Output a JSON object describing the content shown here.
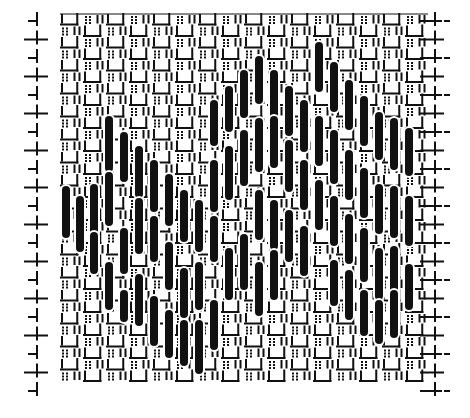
{
  "figure": {
    "description": "Needlework stitch pattern: woven ground with long dark vertical stitches forming a zigzag band",
    "width": 470,
    "height": 418,
    "colors": {
      "ink": "#111111",
      "paper": "#ffffff"
    },
    "grid": {
      "left": 60,
      "top": 14,
      "right": 428,
      "bottom": 384,
      "cell": 11.5,
      "edge_tick_left_x": 30,
      "edge_tick_right_x": 436,
      "edge_tick_rows": 20
    },
    "bars": {
      "width": 8,
      "columns": [
        {
          "x": 66,
          "segments": [
            [
              186,
              238
            ]
          ]
        },
        {
          "x": 80,
          "segments": [
            [
              196,
              252
            ]
          ]
        },
        {
          "x": 94,
          "segments": [
            [
              184,
              236
            ],
            [
              232,
              274
            ]
          ]
        },
        {
          "x": 109,
          "segments": [
            [
              116,
              172
            ],
            [
              172,
              226
            ],
            [
              262,
              310
            ]
          ]
        },
        {
          "x": 124,
          "segments": [
            [
              132,
              182
            ],
            [
              228,
              274
            ],
            [
              290,
              322
            ]
          ]
        },
        {
          "x": 139,
          "segments": [
            [
              146,
              198
            ],
            [
              198,
              254
            ],
            [
              274,
              326
            ]
          ]
        },
        {
          "x": 154,
          "segments": [
            [
              160,
              212
            ],
            [
              216,
              262
            ],
            [
              296,
              346
            ]
          ]
        },
        {
          "x": 169,
          "segments": [
            [
              174,
              226
            ],
            [
              242,
              290
            ],
            [
              310,
              358
            ]
          ]
        },
        {
          "x": 184,
          "segments": [
            [
              190,
              242
            ],
            [
              268,
              318
            ],
            [
              320,
              366
            ]
          ]
        },
        {
          "x": 199,
          "segments": [
            [
              200,
              252
            ],
            [
              262,
              310
            ],
            [
              320,
              374
            ]
          ]
        },
        {
          "x": 214,
          "segments": [
            [
              100,
              146
            ],
            [
              160,
              212
            ],
            [
              216,
              262
            ],
            [
              300,
              350
            ]
          ]
        },
        {
          "x": 229,
          "segments": [
            [
              86,
              132
            ],
            [
              146,
              200
            ],
            [
              248,
              300
            ]
          ]
        },
        {
          "x": 244,
          "segments": [
            [
              70,
              118
            ],
            [
              130,
              186
            ],
            [
              234,
              290
            ]
          ]
        },
        {
          "x": 259,
          "segments": [
            [
              56,
              104
            ],
            [
              118,
              172
            ],
            [
              190,
              240
            ],
            [
              262,
              316
            ]
          ]
        },
        {
          "x": 274,
          "segments": [
            [
              70,
              122
            ],
            [
              116,
              168
            ],
            [
              200,
              250
            ],
            [
              250,
              300
            ]
          ]
        },
        {
          "x": 289,
          "segments": [
            [
              86,
              136
            ],
            [
              140,
              192
            ],
            [
              210,
              262
            ]
          ]
        },
        {
          "x": 304,
          "segments": [
            [
              100,
              152
            ],
            [
              160,
              210
            ],
            [
              226,
              276
            ]
          ]
        },
        {
          "x": 319,
          "segments": [
            [
              42,
              92
            ],
            [
              116,
              166
            ],
            [
              180,
              230
            ]
          ]
        },
        {
          "x": 334,
          "segments": [
            [
              62,
              112
            ],
            [
              130,
              184
            ],
            [
              196,
              246
            ],
            [
              260,
              306
            ]
          ]
        },
        {
          "x": 349,
          "segments": [
            [
              80,
              130
            ],
            [
              150,
              200
            ],
            [
              214,
              264
            ],
            [
              270,
              320
            ]
          ]
        },
        {
          "x": 364,
          "segments": [
            [
              96,
              146
            ],
            [
              168,
              218
            ],
            [
              228,
              282
            ],
            [
              290,
              336
            ]
          ]
        },
        {
          "x": 379,
          "segments": [
            [
              112,
              160
            ],
            [
              184,
              234
            ],
            [
              248,
              300
            ],
            [
              300,
              344
            ]
          ]
        },
        {
          "x": 394,
          "segments": [
            [
              118,
              170
            ],
            [
              186,
              238
            ],
            [
              246,
              296
            ],
            [
              290,
              338
            ]
          ]
        },
        {
          "x": 409,
          "segments": [
            [
              128,
              176
            ],
            [
              196,
              246
            ],
            [
              264,
              310
            ]
          ]
        }
      ]
    }
  }
}
